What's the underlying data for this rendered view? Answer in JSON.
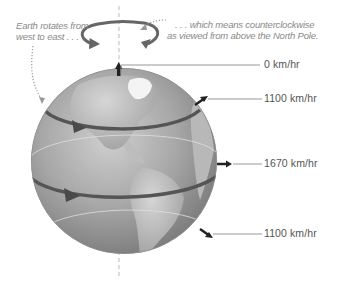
{
  "annotations": {
    "left_caption_line1": "Earth rotates from",
    "left_caption_line2": "west to east . . .",
    "right_caption_line1": ". . . which means counterclockwise",
    "right_caption_line2": "as viewed from above the North Pole."
  },
  "speeds": [
    {
      "label": "0 km/hr",
      "position": "North Pole"
    },
    {
      "label": "1100 km/hr",
      "position": "Northern mid-latitude"
    },
    {
      "label": "1670 km/hr",
      "position": "Equator"
    },
    {
      "label": "1100 km/hr",
      "position": "Southern mid-latitude"
    }
  ],
  "colors": {
    "globe_light": "#c4c4c4",
    "globe_mid": "#9e9e9e",
    "globe_dark": "#6e6e6e",
    "rotation_band": "#555555",
    "leader_line": "#8c8c8c",
    "caption_text": "#8a8a8a",
    "label_text": "#555555"
  }
}
